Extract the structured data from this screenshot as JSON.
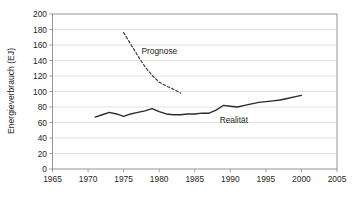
{
  "chart_data": {
    "type": "line",
    "title": "",
    "xlabel": "",
    "ylabel": "Energieverbrauch (EJ)",
    "xlim": [
      1965,
      2005
    ],
    "ylim": [
      0,
      200
    ],
    "grid": true,
    "grid_orientation": "horizontal",
    "legend_position": "inline-annotations",
    "xticks": [
      1965,
      1970,
      1975,
      1980,
      1985,
      1990,
      1995,
      2000,
      2005
    ],
    "yticks": [
      0,
      20,
      40,
      60,
      80,
      100,
      120,
      140,
      160,
      180,
      200
    ],
    "annotations": [
      {
        "text": "Prognose",
        "x": 1977.5,
        "y": 148
      },
      {
        "text": "Realität",
        "x": 1988.5,
        "y": 60
      }
    ],
    "series": [
      {
        "name": "Prognose",
        "style": "dashed",
        "color": "#3a3a4a",
        "x": [
          1975,
          1976,
          1977,
          1978,
          1979,
          1980,
          1981,
          1982,
          1983
        ],
        "values": [
          176,
          161,
          146,
          132,
          121,
          112,
          107,
          103,
          98
        ]
      },
      {
        "name": "Realität",
        "style": "solid",
        "color": "#2a2a2a",
        "x": [
          1971,
          1972,
          1973,
          1974,
          1975,
          1976,
          1977,
          1978,
          1979,
          1980,
          1981,
          1982,
          1983,
          1984,
          1985,
          1986,
          1987,
          1988,
          1989,
          1990,
          1991,
          1992,
          1993,
          1994,
          1995,
          1996,
          1997,
          1998,
          1999,
          2000
        ],
        "values": [
          67,
          70,
          73,
          71,
          68,
          71,
          73,
          75,
          78,
          74,
          71,
          70,
          70,
          71,
          71,
          72,
          72,
          76,
          82,
          81,
          80,
          82,
          84,
          86,
          87,
          88,
          89,
          91,
          93,
          95
        ]
      }
    ]
  },
  "axes": {
    "ylabel": "Energieverbrauch (EJ)",
    "ytick_labels": [
      "200",
      "180",
      "160",
      "140",
      "120",
      "100",
      "80",
      "60",
      "40",
      "20",
      "0"
    ],
    "xtick_labels": [
      "1965",
      "1970",
      "1975",
      "1980",
      "1985",
      "1990",
      "1995",
      "2000",
      "2005"
    ]
  },
  "labels": {
    "prognose": "Prognose",
    "realitaet": "Realität"
  },
  "colors": {
    "background": "#ffffff",
    "gridline": "#c9c9c9",
    "frame": "#8a8a8a",
    "realitaet_line": "#2a2a2a",
    "prognose_line": "#3a3a4a",
    "text": "#231f20"
  }
}
